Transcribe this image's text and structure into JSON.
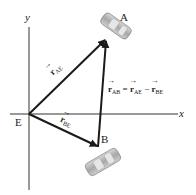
{
  "diagram": {
    "axes": {
      "x_label": "x",
      "y_label": "y"
    },
    "points": {
      "origin": "E",
      "A": "A",
      "B": "B"
    },
    "vectors": [
      {
        "name": "r",
        "sub": "AE",
        "from": "E",
        "to": "A"
      },
      {
        "name": "r",
        "sub": "BE",
        "from": "E",
        "to": "B"
      },
      {
        "name": "r",
        "sub": "AB",
        "from": "B",
        "to": "A"
      }
    ],
    "equation": {
      "lhs_sub": "AB",
      "eq": "=",
      "term1_sub": "AE",
      "minus": "−",
      "term2_sub": "BE",
      "symbol": "r"
    },
    "colors": {
      "line": "#1a1a1a",
      "car": "#b8b8b8",
      "car_dark": "#8a8a8a"
    }
  }
}
